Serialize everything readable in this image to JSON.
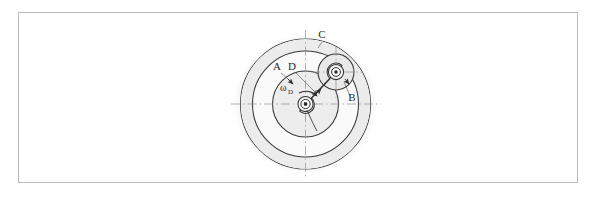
{
  "page": {
    "background_color": "#ffffff",
    "width": 594,
    "height": 208
  },
  "frame": {
    "name": "figure-border",
    "x": 18,
    "y": 12,
    "width": 560,
    "height": 171,
    "stroke_color": "#b9b9b9",
    "fill_color": "#ffffff"
  },
  "figure": {
    "center_x": 305.5,
    "center_y": 104,
    "colors": {
      "outline": "#3a3a3a",
      "thin_outline": "#555555",
      "centerline": "#8a8a99",
      "shade": "#e8e8e8",
      "halo": "#ebebeb",
      "gear_fill": "#fbfbfb",
      "link_fill": "#f2f2f2",
      "hatch": "#2f2f2f",
      "label_color": "#2b2b2b"
    },
    "labels": [
      {
        "id": "label-c",
        "text": "C",
        "x": 322,
        "y": 38,
        "role": "fixed-ring-gear"
      },
      {
        "id": "label-a",
        "text": "A",
        "x": 277,
        "y": 70,
        "role": "sun-gear"
      },
      {
        "id": "label-d",
        "text": "D",
        "x": 292,
        "y": 70,
        "role": "arm-link"
      },
      {
        "id": "label-b",
        "text": "B",
        "x": 352,
        "y": 100,
        "role": "planet-gear"
      }
    ],
    "omega_label": {
      "id": "label-omega-d",
      "base": "ω",
      "subscript": "D",
      "x": 283,
      "y": 91,
      "role": "angular-velocity-of-arm"
    },
    "rings": {
      "outer_ring_gear_radius": 65,
      "inner_ring_boundary_radius": 53,
      "sun_gear_radius": 33,
      "planet_gear_radius": 18,
      "hub_outer_radius": 5,
      "hub_inner_radius": 2.2
    },
    "planet": {
      "center_x": 336,
      "center_y": 72
    },
    "centerlines": [
      {
        "id": "centerline-horizontal",
        "x1": 232,
        "y1": 104,
        "x2": 380,
        "y2": 104
      },
      {
        "id": "centerline-vertical",
        "x1": 305.5,
        "y1": 31,
        "x2": 305.5,
        "y2": 178
      },
      {
        "id": "centerline-planet-horizontal",
        "x1": 312,
        "y1": 72,
        "x2": 362,
        "y2": 72
      },
      {
        "id": "centerline-planet-vertical",
        "x1": 336,
        "y1": 48,
        "x2": 336,
        "y2": 97
      }
    ],
    "hatching": {
      "id": "ground-hatching",
      "description": "hatched band on lower-right of fixed outer ring gear",
      "start_angle_deg": 18,
      "end_angle_deg": 78
    }
  }
}
